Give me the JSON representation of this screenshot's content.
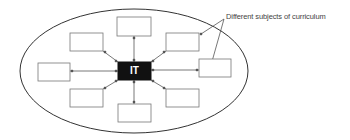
{
  "diagram": {
    "center": {
      "label": "IT",
      "fill": "#111111",
      "text_color": "#ffffff"
    },
    "annotation": {
      "text": "Different subjects of curriculum"
    },
    "subject_boxes": [
      {
        "id": "top",
        "label": ""
      },
      {
        "id": "upper-right",
        "label": ""
      },
      {
        "id": "right",
        "label": ""
      },
      {
        "id": "lower-right",
        "label": ""
      },
      {
        "id": "bottom",
        "label": ""
      },
      {
        "id": "lower-left",
        "label": ""
      },
      {
        "id": "left",
        "label": ""
      },
      {
        "id": "upper-left",
        "label": ""
      }
    ],
    "colors": {
      "line": "#555555",
      "box_border": "#777777",
      "ellipse": "#333333"
    }
  }
}
